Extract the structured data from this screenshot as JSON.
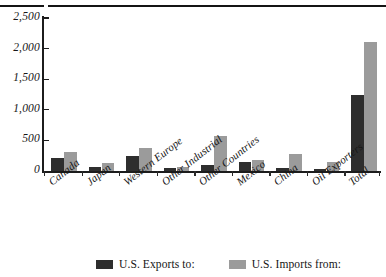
{
  "chart_data": {
    "type": "bar",
    "title": "",
    "subtitle": "",
    "xlabel": "",
    "ylabel": "",
    "ylim": [
      0,
      2500
    ],
    "yticks": [
      0,
      500,
      1000,
      1500,
      2000,
      2500
    ],
    "ytick_labels": [
      "0",
      "500",
      "1,000",
      "1,500",
      "2,000",
      "2,500"
    ],
    "grid": false,
    "legend_position": "bottom",
    "categories": [
      "Canada",
      "Japan",
      "Western Europe",
      "Other Industrial",
      "Other Countries",
      "Mexico",
      "China",
      "Oil Exporters",
      "Total"
    ],
    "series": [
      {
        "name": "U.S. Exports to:",
        "color": "#2e2e2e",
        "values": [
          215,
          65,
          245,
          55,
          100,
          145,
          50,
          35,
          1250
        ]
      },
      {
        "name": "U.S. Imports from:",
        "color": "#9b9b9b",
        "values": [
          310,
          130,
          375,
          60,
          575,
          180,
          280,
          150,
          2100
        ]
      }
    ]
  },
  "legend": {
    "items": [
      {
        "label": "U.S. Exports to:",
        "swatch": "exports"
      },
      {
        "label": "U.S. Imports from:",
        "swatch": "imports"
      }
    ]
  }
}
